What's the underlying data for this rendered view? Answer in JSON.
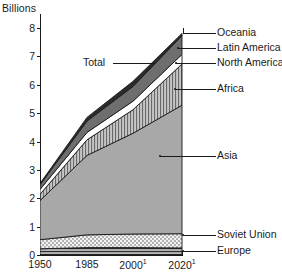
{
  "chart_data": {
    "type": "area",
    "title": "",
    "subtitle": "",
    "xlabel": "",
    "ylabel": "Billions",
    "ylim": [
      0,
      8.4
    ],
    "xlim": [
      1950,
      2020
    ],
    "grid": false,
    "legend_position": "right-callouts",
    "stacked": true,
    "x": [
      1950,
      1985,
      2000,
      2020
    ],
    "x_tick_labels": [
      "1950",
      "1985",
      "2000",
      "2000-sup",
      "2020",
      "2020-sup"
    ],
    "y_tick_labels": [
      "0",
      "1",
      "2",
      "3",
      "4",
      "5",
      "6",
      "7",
      "8"
    ],
    "y_ticks": [
      0,
      1,
      2,
      3,
      4,
      5,
      6,
      7,
      8
    ],
    "units": "Billions of people",
    "footnote_marker": "1",
    "total_label": "Total",
    "totals": [
      2.52,
      4.85,
      6.12,
      7.81
    ],
    "series": [
      {
        "name": "Europe",
        "key": "europe",
        "pattern": "horizontal-lines",
        "fill": "#9a9a9a",
        "values": [
          0.22,
          0.26,
          0.26,
          0.25
        ]
      },
      {
        "name": "Soviet Union",
        "key": "soviet-union",
        "pattern": "stipple",
        "fill": "#efefef",
        "values": [
          0.32,
          0.45,
          0.48,
          0.5
        ]
      },
      {
        "name": "Asia",
        "key": "asia",
        "pattern": "solid-gray",
        "fill": "#a8a8a8",
        "values": [
          1.38,
          2.8,
          3.55,
          4.53
        ]
      },
      {
        "name": "Africa",
        "key": "africa",
        "pattern": "vertical-lines",
        "fill": "#b9b9b9",
        "values": [
          0.22,
          0.55,
          0.83,
          1.45
        ]
      },
      {
        "name": "North America",
        "key": "north-america",
        "pattern": "white",
        "fill": "#ffffff",
        "values": [
          0.17,
          0.26,
          0.3,
          0.34
        ]
      },
      {
        "name": "Latin America",
        "key": "latin-america",
        "pattern": "dark-gray",
        "fill": "#6e6e6e",
        "values": [
          0.17,
          0.4,
          0.52,
          0.66
        ]
      },
      {
        "name": "Oceania",
        "key": "oceania",
        "pattern": "black",
        "fill": "#2b2b2b",
        "values": [
          0.04,
          0.13,
          0.18,
          0.08
        ]
      }
    ]
  },
  "axes": {
    "y_title": "Billions",
    "y_ticks": [
      "8",
      "7",
      "6",
      "5",
      "4",
      "3",
      "2",
      "1",
      "0"
    ],
    "x_ticks": [
      {
        "label": "1950",
        "sup": ""
      },
      {
        "label": "1985",
        "sup": ""
      },
      {
        "label": "2000",
        "sup": "1"
      },
      {
        "label": "2020",
        "sup": "1"
      }
    ]
  },
  "annotations": {
    "total": "Total",
    "oceania": "Oceania",
    "latin_america": "Latin America",
    "north_america": "North America",
    "africa": "Africa",
    "asia": "Asia",
    "soviet_union": "Soviet Union",
    "europe": "Europe"
  },
  "colors": {
    "axis": "#1a1a1a",
    "text": "#1a1a1a",
    "background": "#ffffff",
    "oceania": "#2b2b2b",
    "latin_america": "#6e6e6e",
    "north_america": "#ffffff",
    "africa": "#b9b9b9",
    "asia": "#a8a8a8",
    "soviet_union": "#efefef",
    "europe": "#9a9a9a"
  }
}
